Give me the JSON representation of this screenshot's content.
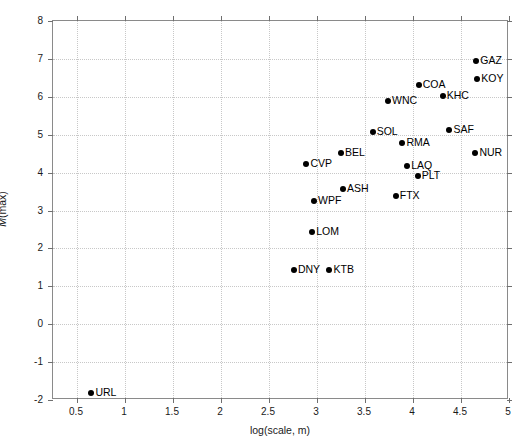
{
  "chart_data": {
    "type": "scatter",
    "title": "",
    "xlabel": "log(scale, m)",
    "ylabel": "M(max)",
    "xlim": [
      0.25,
      5.0
    ],
    "ylim": [
      -2,
      8
    ],
    "grid": true,
    "legend": null,
    "xticks": [
      "0.5",
      "1",
      "1.5",
      "2",
      "2.5",
      "3",
      "3.5",
      "4",
      "4.5",
      "5"
    ],
    "xtick_values": [
      0.5,
      1,
      1.5,
      2,
      2.5,
      3,
      3.5,
      4,
      4.5,
      5
    ],
    "yticks": [
      "8",
      "7",
      "6",
      "5",
      "4",
      "3",
      "2",
      "1",
      "0",
      "-1",
      "-2"
    ],
    "ytick_values": [
      8,
      7,
      6,
      5,
      4,
      3,
      2,
      1,
      0,
      -1,
      -2
    ],
    "points": [
      {
        "label": "URL",
        "x": 0.65,
        "y": -1.81
      },
      {
        "label": "DNY",
        "x": 2.76,
        "y": 1.43
      },
      {
        "label": "KTB",
        "x": 3.13,
        "y": 1.43
      },
      {
        "label": "LOM",
        "x": 2.95,
        "y": 2.43
      },
      {
        "label": "WPF",
        "x": 2.97,
        "y": 3.25
      },
      {
        "label": "ASH",
        "x": 3.27,
        "y": 3.57
      },
      {
        "label": "FTX",
        "x": 3.82,
        "y": 3.38
      },
      {
        "label": "PLT",
        "x": 4.05,
        "y": 3.91
      },
      {
        "label": "LAQ",
        "x": 3.94,
        "y": 4.17
      },
      {
        "label": "CVP",
        "x": 2.89,
        "y": 4.23
      },
      {
        "label": "BEL",
        "x": 3.25,
        "y": 4.52
      },
      {
        "label": "NUR",
        "x": 4.65,
        "y": 4.52
      },
      {
        "label": "RMA",
        "x": 3.89,
        "y": 4.78
      },
      {
        "label": "SOL",
        "x": 3.58,
        "y": 5.07
      },
      {
        "label": "SAF",
        "x": 4.38,
        "y": 5.12
      },
      {
        "label": "WNC",
        "x": 3.74,
        "y": 5.89
      },
      {
        "label": "KHC",
        "x": 4.31,
        "y": 6.02
      },
      {
        "label": "COA",
        "x": 4.06,
        "y": 6.31
      },
      {
        "label": "KOY",
        "x": 4.67,
        "y": 6.47
      },
      {
        "label": "GAZ",
        "x": 4.66,
        "y": 6.94
      }
    ],
    "marker_color": "#000000",
    "grid_color": "#c8c8c8",
    "axis_color": "#8a8a8a"
  },
  "axis": {
    "x_title": "log(scale, m)",
    "y_title_var": "M",
    "y_title_rest": "(max)"
  }
}
